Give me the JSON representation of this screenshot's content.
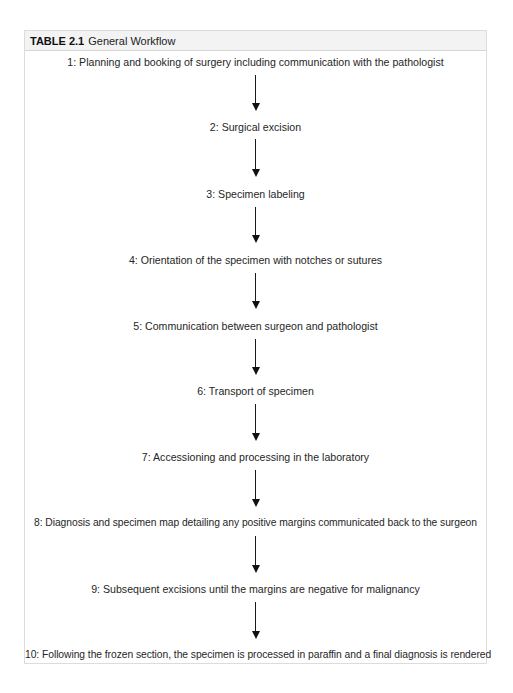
{
  "table": {
    "number": "TABLE 2.1",
    "title": "General Workflow"
  },
  "steps": [
    {
      "label": "1: Planning and booking of surgery including communication with the pathologist"
    },
    {
      "label": "2: Surgical excision"
    },
    {
      "label": "3: Specimen labeling"
    },
    {
      "label": "4: Orientation of the specimen with notches or sutures"
    },
    {
      "label": "5: Communication between surgeon and pathologist"
    },
    {
      "label": "6: Transport of specimen"
    },
    {
      "label": "7: Accessioning and processing in the laboratory"
    },
    {
      "label": "8: Diagnosis and specimen map detailing any positive margins communicated back to the surgeon"
    },
    {
      "label": "9: Subsequent excisions until the margins are negative for malignancy"
    },
    {
      "label": "10: Following the frozen section, the specimen is processed in paraffin and a final diagnosis is rendered"
    }
  ],
  "colors": {
    "border": "#dcdcdc",
    "header_background": "#f3f3f3",
    "text": "#222222",
    "arrow": "#111111"
  }
}
